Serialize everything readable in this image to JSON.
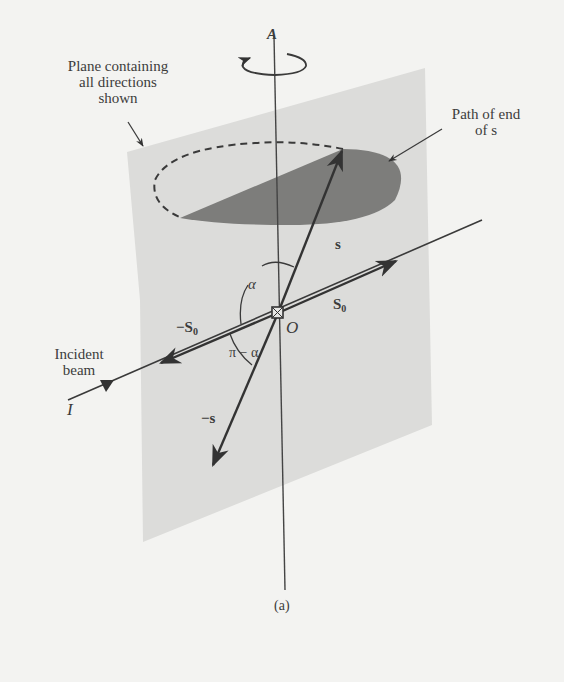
{
  "figure": {
    "caption": "(a)",
    "colors": {
      "background": "#f3f3f1",
      "plane": "#dcdcda",
      "shaded_cone_section": "#7d7d7b",
      "lines": "#3a3a3a"
    },
    "annotations": {
      "plane_label_line1": "Plane containing",
      "plane_label_line2": "all directions",
      "plane_label_line3": "shown",
      "path_label_line1": "Path of end",
      "path_label_line2": "of s",
      "incident_label_line1": "Incident",
      "incident_label_line2": "beam"
    },
    "symbols": {
      "axis": "A",
      "origin": "O",
      "beam_source": "I",
      "scattered": "s",
      "neg_scattered": "−s",
      "s0_main": "S",
      "s0_sub": "0",
      "neg_s0_prefix": "−S",
      "neg_s0_sub": "0",
      "alpha": "α",
      "pi_minus_alpha": "π − α"
    }
  }
}
